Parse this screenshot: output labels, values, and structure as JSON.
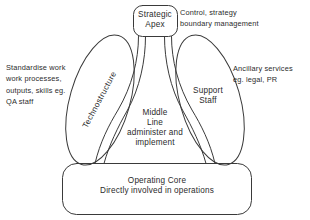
{
  "diagram": {
    "background_color": "#ffffff",
    "stroke_color": "#3a3a3a",
    "text_color": "#2b2b2b"
  },
  "components": {
    "strategic_apex": {
      "label": "Strategic\nApex",
      "shape": "rounded-rectangle"
    },
    "technostructure": {
      "label": "Technostructure",
      "shape": "tilted-ellipse"
    },
    "support_staff": {
      "label": "Support\nStaff",
      "shape": "tilted-ellipse"
    },
    "middle_line": {
      "label": "Middle\nLine\nadminister and\nimplement",
      "shape": "flared-band"
    },
    "operating_core": {
      "label": "Operating Core\nDirectly involved in operations",
      "shape": "rounded-rectangle"
    }
  },
  "annotations": {
    "strategic_apex_note": "Control, strategy\nboundary management",
    "technostructure_note": "Standardise work\nwork processes,\noutputs, skills eg.\nQA staff",
    "support_staff_note": "Ancillary services\neg. legal, PR"
  }
}
